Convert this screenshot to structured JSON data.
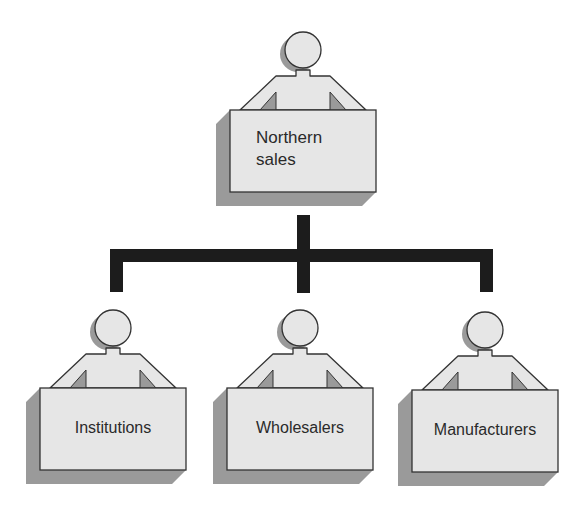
{
  "diagram": {
    "type": "org-chart",
    "root": {
      "id": "northern-sales",
      "label_line1": "Northern",
      "label_line2": "sales"
    },
    "children": [
      {
        "id": "institutions",
        "label": "Institutions"
      },
      {
        "id": "wholesalers",
        "label": "Wholesalers"
      },
      {
        "id": "manufacturers",
        "label": "Manufacturers"
      }
    ],
    "colors": {
      "box_fill": "#e6e6e6",
      "box_stroke": "#333333",
      "shadow": "#9a9a9a",
      "connector": "#1c1c1c",
      "background": "#ffffff"
    }
  }
}
